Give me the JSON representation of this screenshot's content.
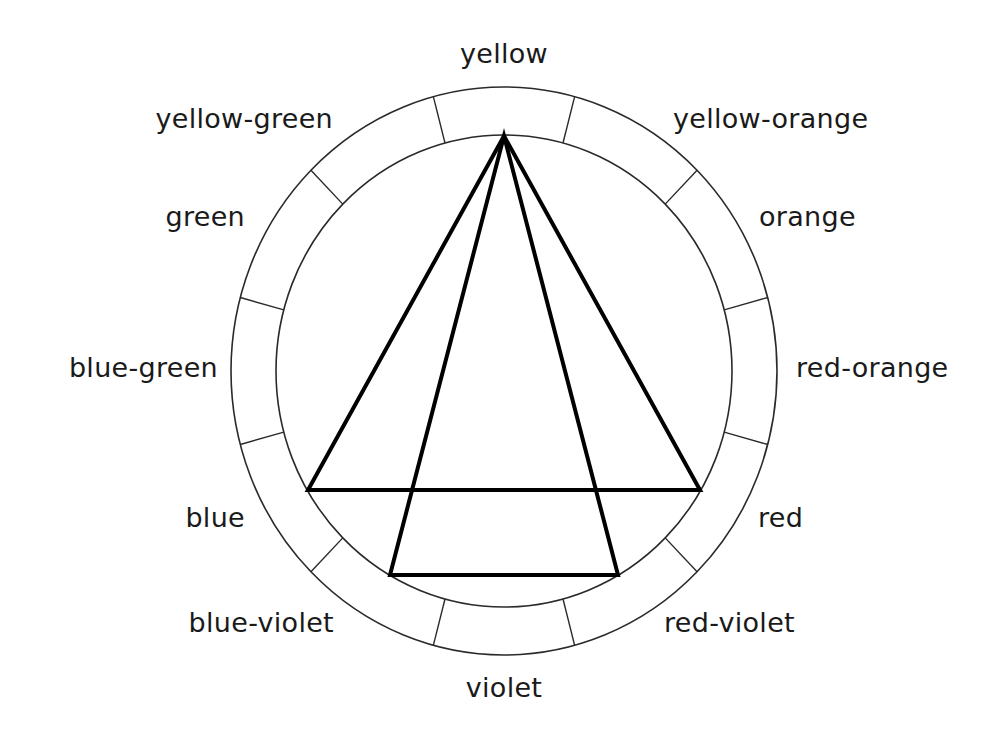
{
  "diagram": {
    "type": "color-wheel",
    "center": {
      "x": 504,
      "y": 371
    },
    "outer_radius": {
      "rx": 273,
      "ry": 284
    },
    "inner_radius": {
      "rx": 228,
      "ry": 236
    },
    "segment_count": 12,
    "labels": [
      {
        "name": "yellow",
        "x": 504,
        "y": 63,
        "anchor": "middle"
      },
      {
        "name": "yellow-orange",
        "x": 673,
        "y": 128,
        "anchor": "start"
      },
      {
        "name": "orange",
        "x": 759,
        "y": 226,
        "anchor": "start"
      },
      {
        "name": "red-orange",
        "x": 796,
        "y": 377,
        "anchor": "start"
      },
      {
        "name": "red",
        "x": 758,
        "y": 527,
        "anchor": "start"
      },
      {
        "name": "red-violet",
        "x": 664,
        "y": 632,
        "anchor": "start"
      },
      {
        "name": "violet",
        "x": 504,
        "y": 697,
        "anchor": "middle"
      },
      {
        "name": "blue-violet",
        "x": 334,
        "y": 632,
        "anchor": "end"
      },
      {
        "name": "blue",
        "x": 245,
        "y": 527,
        "anchor": "end"
      },
      {
        "name": "blue-green",
        "x": 218,
        "y": 377,
        "anchor": "end"
      },
      {
        "name": "green",
        "x": 245,
        "y": 226,
        "anchor": "end"
      },
      {
        "name": "yellow-green",
        "x": 333,
        "y": 128,
        "anchor": "end"
      }
    ],
    "triangles": [
      {
        "name": "outer-triangle",
        "vertices": [
          "yellow",
          "blue",
          "red"
        ],
        "points": [
          [
            504,
            136
          ],
          [
            308,
            490
          ],
          [
            700,
            490
          ]
        ]
      },
      {
        "name": "inner-triangle",
        "vertices": [
          "yellow",
          "blue-violet",
          "red-violet"
        ],
        "points": [
          [
            504,
            136
          ],
          [
            390,
            575
          ],
          [
            618,
            575
          ]
        ]
      }
    ],
    "colors": {
      "ring_stroke": "#2a2a2a",
      "triangle_stroke": "#000000",
      "background": "#ffffff",
      "text": "#1a1a1a"
    }
  }
}
